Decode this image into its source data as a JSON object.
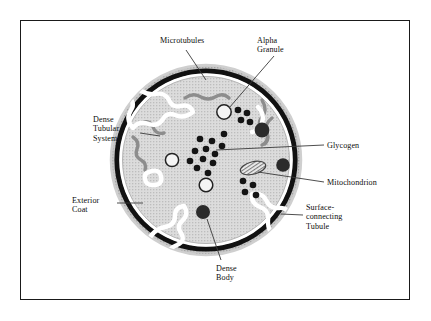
{
  "figure": {
    "kind": "platelet-anatomy-diagram",
    "border_color": "#1a1a1a",
    "background_color": "#ffffff"
  },
  "colors": {
    "exterior_coat": "#b8b8b8",
    "membrane": "#111111",
    "microtubule_band": "#ffffff",
    "cytoplasm": "#d4d4d4",
    "dense_tubular_system": "#8a8a8a",
    "granule_fill": "#f2f2f2",
    "granule_stroke": "#222222",
    "dense_body": "#2b2b2b",
    "glycogen": "#141414",
    "mitochondrion_fill": "#e8e8e8",
    "leader_line": "#3a3a3a"
  },
  "labels": [
    {
      "id": "microtubules",
      "text": "Microtubules"
    },
    {
      "id": "alpha_granule",
      "text": "Alpha\nGranule"
    },
    {
      "id": "dense_tubular_system",
      "text": "Dense\nTubular\nSystem"
    },
    {
      "id": "exterior_coat",
      "text": "Exterior\nCoat"
    },
    {
      "id": "glycogen",
      "text": "Glycogen"
    },
    {
      "id": "mitochondrion",
      "text": "Mitochondrion"
    },
    {
      "id": "surface_connecting_tubule",
      "text": "Surface-\nconnecting\nTubule"
    },
    {
      "id": "dense_body",
      "text": "Dense\nBody"
    }
  ],
  "structures": {
    "glycogen_particles": 12,
    "alpha_granules": 3,
    "dense_bodies": 3,
    "mitochondria": 1,
    "surface_tubule_openings": 3
  }
}
